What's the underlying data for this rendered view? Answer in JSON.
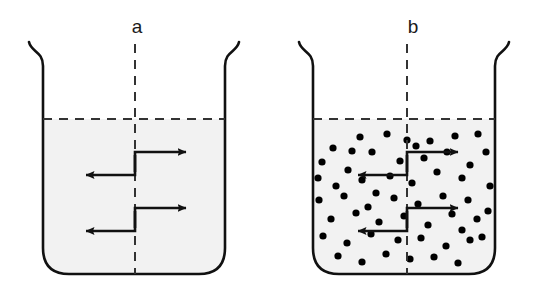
{
  "figure": {
    "title": "",
    "background_color": "#ffffff",
    "line_color": "#111111",
    "liquid_fill_color": "#f2f2f2",
    "particle_color": "#000000",
    "dash_color": "#333333"
  },
  "panels": [
    {
      "id": "panel-a",
      "label": "a",
      "label_x": 137,
      "label_y": 33,
      "beaker": {
        "left": 43,
        "right": 225,
        "top": 42,
        "bottom": 274,
        "corner_radius": 26,
        "rim_flare": 14,
        "wall_thickness": 2.6
      },
      "liquid_level_y": 119,
      "center_line_x": 135,
      "center_line_top": 44,
      "center_line_bottom": 274,
      "particles": [],
      "particle_count": 0,
      "arrows": [
        {
          "direction": "right",
          "stub_x": 135,
          "stub_y": 172,
          "tip_y": 152,
          "tip_x": 186
        },
        {
          "direction": "left",
          "stub_x": 135,
          "stub_y": 155,
          "tip_y": 175,
          "tip_x": 86
        },
        {
          "direction": "right",
          "stub_x": 135,
          "stub_y": 228,
          "tip_y": 208,
          "tip_x": 186
        },
        {
          "direction": "left",
          "stub_x": 135,
          "stub_y": 211,
          "tip_y": 231,
          "tip_x": 86
        }
      ]
    },
    {
      "id": "panel-b",
      "label": "b",
      "label_x": 413,
      "label_y": 33,
      "beaker": {
        "left": 313,
        "right": 495,
        "top": 42,
        "bottom": 274,
        "corner_radius": 26,
        "rim_flare": 14,
        "wall_thickness": 2.6
      },
      "liquid_level_y": 119,
      "center_line_x": 407,
      "center_line_top": 44,
      "center_line_bottom": 274,
      "particle_radius": 3.6,
      "particle_count": 56,
      "particles": [
        [
          333,
          148
        ],
        [
          360,
          137
        ],
        [
          387,
          134
        ],
        [
          407,
          140
        ],
        [
          430,
          141
        ],
        [
          455,
          136
        ],
        [
          478,
          134
        ],
        [
          322,
          162
        ],
        [
          348,
          170
        ],
        [
          372,
          152
        ],
        [
          400,
          161
        ],
        [
          424,
          158
        ],
        [
          447,
          152
        ],
        [
          470,
          165
        ],
        [
          336,
          186
        ],
        [
          362,
          180
        ],
        [
          390,
          176
        ],
        [
          412,
          183
        ],
        [
          437,
          172
        ],
        [
          462,
          178
        ],
        [
          486,
          152
        ],
        [
          319,
          200
        ],
        [
          344,
          196
        ],
        [
          368,
          207
        ],
        [
          394,
          198
        ],
        [
          418,
          204
        ],
        [
          443,
          196
        ],
        [
          468,
          200
        ],
        [
          331,
          219
        ],
        [
          356,
          213
        ],
        [
          379,
          222
        ],
        [
          404,
          216
        ],
        [
          428,
          225
        ],
        [
          452,
          214
        ],
        [
          477,
          219
        ],
        [
          323,
          236
        ],
        [
          347,
          243
        ],
        [
          371,
          234
        ],
        [
          398,
          240
        ],
        [
          421,
          238
        ],
        [
          446,
          246
        ],
        [
          470,
          240
        ],
        [
          338,
          256
        ],
        [
          362,
          262
        ],
        [
          386,
          254
        ],
        [
          410,
          259
        ],
        [
          434,
          257
        ],
        [
          458,
          263
        ],
        [
          482,
          237
        ],
        [
          352,
          151
        ],
        [
          490,
          186
        ],
        [
          488,
          211
        ],
        [
          318,
          178
        ],
        [
          376,
          193
        ],
        [
          416,
          146
        ],
        [
          462,
          230
        ]
      ],
      "arrows": [
        {
          "direction": "right",
          "stub_x": 407,
          "stub_y": 172,
          "tip_y": 152,
          "tip_x": 458
        },
        {
          "direction": "left",
          "stub_x": 407,
          "stub_y": 155,
          "tip_y": 175,
          "tip_x": 358
        },
        {
          "direction": "right",
          "stub_x": 407,
          "stub_y": 228,
          "tip_y": 208,
          "tip_x": 458
        },
        {
          "direction": "left",
          "stub_x": 407,
          "stub_y": 211,
          "tip_y": 231,
          "tip_x": 358
        }
      ]
    }
  ]
}
